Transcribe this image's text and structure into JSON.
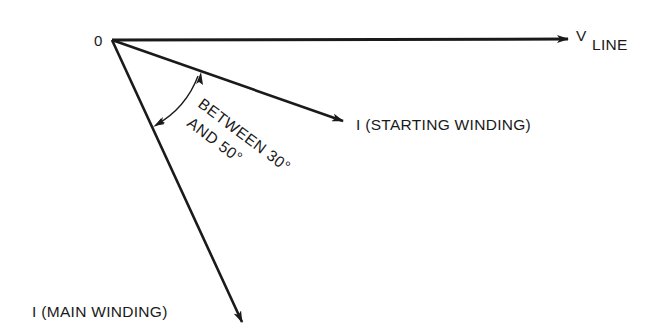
{
  "diagram": {
    "type": "phasor-diagram",
    "origin_label": "0",
    "phasors": [
      {
        "id": "v_line",
        "label_main": "V",
        "label_sub": "LINE",
        "direction": "reference (0°)"
      },
      {
        "id": "i_starting",
        "label": "I (STARTING WINDING)"
      },
      {
        "id": "i_main",
        "label": "I (MAIN WINDING)"
      }
    ],
    "angle_annotation": {
      "line1": "BETWEEN 30°",
      "line1_a": "BETWEEN",
      "line1_b": "30°",
      "line2": "AND 50°"
    },
    "colors": {
      "stroke": "#1a1a1a",
      "background": "#ffffff"
    }
  }
}
